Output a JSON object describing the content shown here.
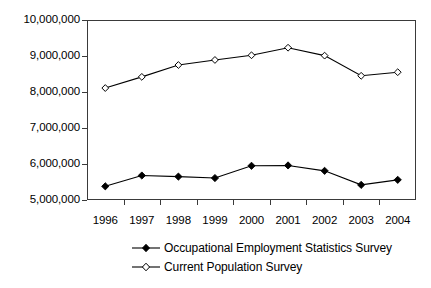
{
  "chart_data": {
    "type": "line",
    "title": "",
    "xlabel": "",
    "ylabel": "",
    "categories": [
      "1996",
      "1997",
      "1998",
      "1999",
      "2000",
      "2001",
      "2002",
      "2003",
      "2004"
    ],
    "ylim": [
      5000000,
      10000000
    ],
    "y_ticks": [
      "5,000,000",
      "6,000,000",
      "7,000,000",
      "8,000,000",
      "9,000,000",
      "10,000,000"
    ],
    "y_tick_values": [
      5000000,
      6000000,
      7000000,
      8000000,
      9000000,
      10000000
    ],
    "grid": false,
    "legend_position": "bottom",
    "series": [
      {
        "name": "Occupational Employment Statistics Survey",
        "marker": "filled-diamond",
        "color": "#000000",
        "values": [
          5380000,
          5680000,
          5650000,
          5610000,
          5950000,
          5960000,
          5810000,
          5420000,
          5560000
        ]
      },
      {
        "name": "Current Population Survey",
        "marker": "open-diamond",
        "color": "#000000",
        "values": [
          8110000,
          8420000,
          8750000,
          8890000,
          9020000,
          9230000,
          9010000,
          8450000,
          8550000
        ]
      }
    ]
  },
  "legend": {
    "items": [
      {
        "label": "Occupational Employment Statistics Survey",
        "marker": "filled-diamond"
      },
      {
        "label": "Current Population Survey",
        "marker": "open-diamond"
      }
    ]
  }
}
